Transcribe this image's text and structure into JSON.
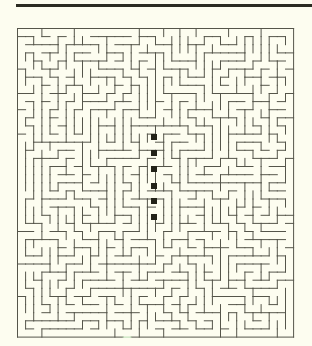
{
  "page": {
    "background": "#fdfdf0",
    "width": 312,
    "height": 346
  },
  "top_bar": {
    "color": "#2b2b22",
    "x": 16,
    "y": 4,
    "width": 296,
    "height": 3
  },
  "maze": {
    "x": 17,
    "y": 28,
    "cols": 34,
    "rows": 38,
    "cell_size": 8.12,
    "wall_color": "#55554a",
    "wall_width": 1,
    "seed": 73191,
    "exit": {
      "side": "bottom",
      "col": 13,
      "color": "#b8dcb0"
    }
  },
  "markers": {
    "color": "#222218",
    "size": 6,
    "items": [
      {
        "x": 154,
        "y": 137
      },
      {
        "x": 154,
        "y": 153
      },
      {
        "x": 154,
        "y": 169
      },
      {
        "x": 154,
        "y": 186
      },
      {
        "x": 154,
        "y": 201
      },
      {
        "x": 154,
        "y": 217
      }
    ]
  }
}
